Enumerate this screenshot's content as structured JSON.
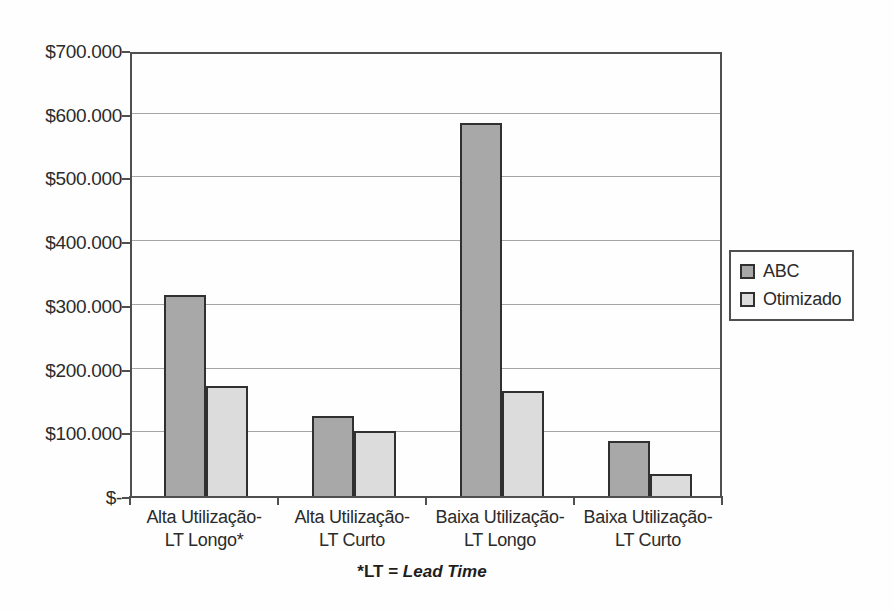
{
  "chart_data": {
    "type": "bar",
    "title": "",
    "categories": [
      "Alta Utilização-LT Longo*",
      "Alta Utilização-LT Curto",
      "Baixa Utilização-LT Longo",
      "Baixa Utilização-LT Curto"
    ],
    "series": [
      {
        "name": "ABC",
        "color": "#a8a8a8",
        "values": [
          315000,
          125000,
          585000,
          86000
        ]
      },
      {
        "name": "Otimizado",
        "color": "#dcdcdc",
        "values": [
          172000,
          102000,
          165000,
          35000
        ]
      }
    ],
    "ylim": [
      0,
      700000
    ],
    "ytick_step": 100000,
    "ytick_labels": [
      "$-",
      "$100.000",
      "$200.000",
      "$300.000",
      "$400.000",
      "$500.000",
      "$600.000",
      "$700.000"
    ],
    "xlabel": "",
    "ylabel": "",
    "grid": "horizontal",
    "legend_position": "right",
    "footnote": {
      "prefix": "*LT = ",
      "italic": "Lead Time"
    }
  }
}
